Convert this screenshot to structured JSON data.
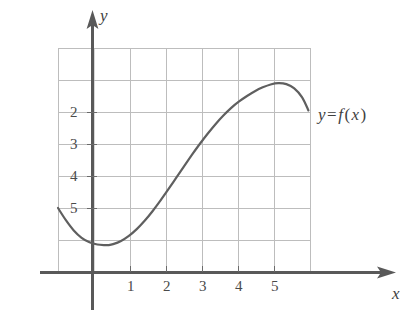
{
  "figure": {
    "kind": "cartesian-graph",
    "background": "#ffffff",
    "axis_color": "#555555",
    "grid_color": "#b9b9b9",
    "curve_color": "#5f5f5f",
    "label_color": "#4a4a4a"
  },
  "axes": {
    "x_axis_name": "x",
    "y_axis_name": "y",
    "x_tick_labels": [
      "1",
      "2",
      "3",
      "4",
      "5"
    ],
    "y_tick_labels": [
      "2",
      "3",
      "4",
      "5"
    ]
  },
  "annotations": {
    "curve_label_y": "y",
    "curve_label_equals": "=",
    "curve_label_f": "f",
    "curve_label_open": "(",
    "curve_label_var": "x",
    "curve_label_close": ")",
    "curve_label_full": "y = f(x)"
  },
  "chart_data": {
    "type": "line",
    "title": "",
    "xlabel": "x",
    "ylabel": "y",
    "xlim": [
      -1.0,
      7.0
    ],
    "ylim": [
      0.0,
      7.0
    ],
    "xticks": [
      1,
      2,
      3,
      4,
      5
    ],
    "yticks": [
      2,
      3,
      4,
      5
    ],
    "grid": true,
    "grid_x_lines": [
      -1,
      0,
      1,
      2,
      3,
      4,
      5,
      6,
      7
    ],
    "grid_y_lines": [
      0,
      1,
      2,
      3,
      4,
      5,
      6,
      7
    ],
    "legend": "y = f(x)",
    "legend_position": "right-of-curve-end",
    "series": [
      {
        "name": "f(x)",
        "x": [
          -1.0,
          -0.75,
          -0.5,
          -0.25,
          0.0,
          0.25,
          0.5,
          0.6,
          0.75,
          1.0,
          1.25,
          1.5,
          1.75,
          2.0,
          2.25,
          2.5,
          2.75,
          3.0,
          3.25,
          3.5,
          3.75,
          4.0,
          4.25,
          4.5,
          4.75,
          5.0,
          5.25,
          5.5,
          5.75,
          6.0,
          6.25,
          6.5,
          6.75,
          6.95
        ],
        "y": [
          2.0,
          1.62,
          1.3,
          1.07,
          0.93,
          0.86,
          0.84,
          0.84,
          0.87,
          0.97,
          1.13,
          1.34,
          1.6,
          1.9,
          2.23,
          2.58,
          2.94,
          3.3,
          3.66,
          4.0,
          4.32,
          4.62,
          4.89,
          5.13,
          5.33,
          5.5,
          5.65,
          5.77,
          5.86,
          5.9,
          5.87,
          5.74,
          5.46,
          5.05
        ]
      }
    ],
    "features": {
      "local_minimum": {
        "x": 0.55,
        "y": 0.84
      },
      "local_maximum": {
        "x": 6.05,
        "y": 5.9
      },
      "left_endpoint": {
        "x": -1.0,
        "y": 2.0
      },
      "right_endpoint": {
        "x": 6.95,
        "y": 5.05
      }
    }
  }
}
